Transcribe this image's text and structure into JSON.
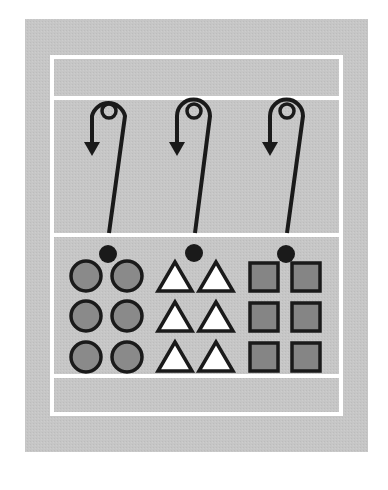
{
  "diagram": {
    "type": "court-drill",
    "colors": {
      "background": "#ffffff",
      "field": "#c4c4c4",
      "court_lines": "#ffffff",
      "ink": "#1a1a1a",
      "circle_fill": "#8a8a8a",
      "triangle_fill": "#ffffff",
      "square_fill": "#858585"
    },
    "field": {
      "x": 25,
      "y": 19,
      "width": 343,
      "height": 433
    },
    "court": {
      "outer": {
        "x": 52,
        "y": 57,
        "width": 289,
        "height": 357
      },
      "lines_y": [
        98,
        235,
        376
      ],
      "line_width": 4
    },
    "players": [
      {
        "name": "player-1",
        "marker": {
          "cx": 108,
          "cy": 254,
          "r": 9
        },
        "target_circle": {
          "cx": 109,
          "cy": 111,
          "r": 7
        },
        "path": "M109 233 L125 116 A17 17 0 0 0 92 116 L92 145",
        "arrow": "M84 142 L100 142 L92 156 Z"
      },
      {
        "name": "player-2",
        "marker": {
          "cx": 194,
          "cy": 253,
          "r": 9
        },
        "target_circle": {
          "cx": 194,
          "cy": 111,
          "r": 7
        },
        "path": "M195 233 L210 116 A16.5 16.5 0 0 0 177 116 L177 145",
        "arrow": "M169 142 L185 142 L177 156 Z"
      },
      {
        "name": "player-3",
        "marker": {
          "cx": 286,
          "cy": 254,
          "r": 9
        },
        "target_circle": {
          "cx": 287,
          "cy": 111,
          "r": 7
        },
        "path": "M287 233 L303 116 A16.5 16.5 0 0 0 270 116 L270 145",
        "arrow": "M262 142 L278 142 L270 156 Z"
      }
    ],
    "groups": [
      {
        "name": "circles",
        "shape": "circle",
        "items": [
          {
            "cx": 86,
            "cy": 276,
            "r": 15
          },
          {
            "cx": 127,
            "cy": 276,
            "r": 15
          },
          {
            "cx": 86,
            "cy": 316,
            "r": 15
          },
          {
            "cx": 127,
            "cy": 316,
            "r": 15
          },
          {
            "cx": 86,
            "cy": 357,
            "r": 15
          },
          {
            "cx": 127,
            "cy": 357,
            "r": 15
          }
        ]
      },
      {
        "name": "triangles",
        "shape": "triangle",
        "items": [
          {
            "points": "175,262 158,291 192,291"
          },
          {
            "points": "216,262 199,291 233,291"
          },
          {
            "points": "175,302 158,331 192,331"
          },
          {
            "points": "216,302 199,331 233,331"
          },
          {
            "points": "175,342 158,371 192,371"
          },
          {
            "points": "216,342 199,371 233,371"
          }
        ]
      },
      {
        "name": "squares",
        "shape": "square",
        "items": [
          {
            "x": 250,
            "y": 263,
            "w": 28,
            "h": 28
          },
          {
            "x": 292,
            "y": 263,
            "w": 28,
            "h": 28
          },
          {
            "x": 250,
            "y": 303,
            "w": 28,
            "h": 28
          },
          {
            "x": 292,
            "y": 303,
            "w": 28,
            "h": 28
          },
          {
            "x": 250,
            "y": 343,
            "w": 28,
            "h": 28
          },
          {
            "x": 292,
            "y": 343,
            "w": 28,
            "h": 28
          }
        ]
      }
    ]
  }
}
